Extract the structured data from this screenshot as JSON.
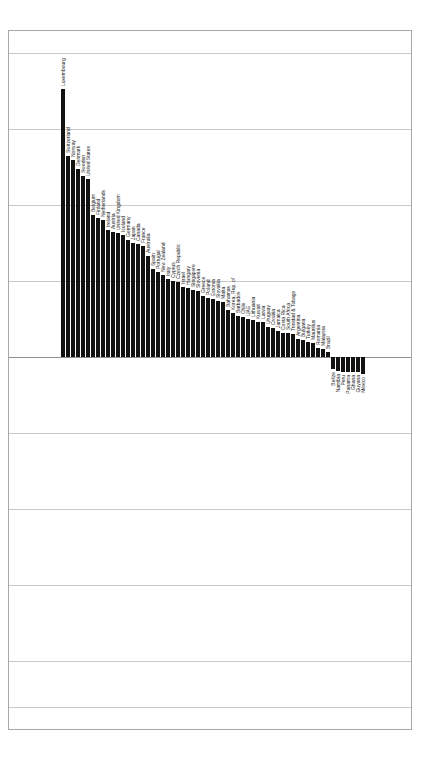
{
  "chart_data": {
    "type": "bar",
    "title": "",
    "subtitle": "",
    "xlabel": "",
    "ylabel": "",
    "grid": true,
    "legend": "none",
    "orientation": "vertical",
    "bar_color": "#121212",
    "ylim": [
      -12,
      100
    ],
    "gridline_values": [
      100,
      75,
      50,
      25,
      0,
      -25,
      -50,
      -75,
      -100,
      -125
    ],
    "categories": [
      "Luxembourg",
      "Switzerland",
      "Norway",
      "Denmark",
      "Sweden",
      "United States",
      "Belgium",
      "Finland",
      "Netherlands",
      "Ireland",
      "Austria",
      "United Kingdom",
      "Iceland",
      "Germany",
      "Japan",
      "Canada",
      "France",
      "Australia",
      "Spain",
      "Portugal",
      "New Zealand",
      "Italy",
      "Cyprus",
      "Czech Republic",
      "Israel",
      "Hungary",
      "Singapore",
      "Slovenia",
      "Greece",
      "Poland",
      "Estonia",
      "Slovakia",
      "Malta",
      "Bahamas",
      "Korea, Rep. of",
      "Barbados",
      "Chile",
      "UAE",
      "Lithuania",
      "Kuwait",
      "Latvia",
      "Uruguay",
      "Croatia",
      "Jamaica",
      "Costa Rica",
      "South Africa",
      "Trinidad & Tobago",
      "Argentina",
      "Bulgaria",
      "Turkey",
      "Mauritius",
      "Romania",
      "Malaysia",
      "Brazil",
      "Belize",
      "Namibia",
      "Peru",
      "Panama",
      "Ghana",
      "Guyana",
      "México"
    ],
    "values": [
      88.0,
      66.0,
      64.5,
      61.5,
      59.5,
      58.5,
      46.5,
      45.5,
      45.0,
      41.5,
      41.0,
      40.5,
      40.0,
      38.5,
      37.5,
      37.0,
      36.5,
      33.0,
      29.0,
      28.0,
      27.0,
      25.5,
      25.0,
      24.5,
      23.0,
      22.5,
      22.0,
      21.5,
      20.0,
      19.5,
      19.0,
      18.5,
      18.0,
      15.5,
      14.5,
      13.5,
      13.0,
      12.5,
      12.0,
      11.5,
      11.5,
      10.0,
      9.5,
      8.5,
      8.0,
      8.0,
      7.5,
      6.0,
      5.5,
      5.0,
      4.5,
      3.0,
      2.5,
      1.5,
      -4.0,
      -4.5,
      -5.0,
      -5.0,
      -5.0,
      -5.0,
      -5.5
    ]
  }
}
